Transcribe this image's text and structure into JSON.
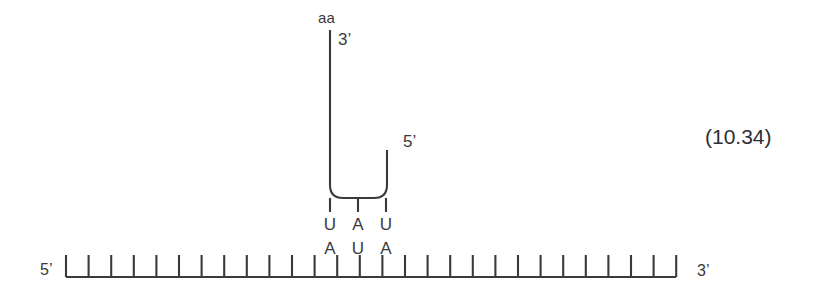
{
  "figure": {
    "equation_number": "(10.34)",
    "background_color": "#ffffff",
    "line_color": "#3a3a3a",
    "text_color": "#3a3a3a"
  },
  "trna": {
    "amino_acid_label": "aa",
    "acceptor_end_label": "3’",
    "five_prime_label": "5’",
    "anticodon": [
      "U",
      "A",
      "U"
    ]
  },
  "mrna": {
    "five_prime_label": "5’",
    "three_prime_label": "3’",
    "codon": [
      "A",
      "U",
      "A"
    ],
    "tick_count": 28,
    "tick_start_x": 66,
    "tick_spacing": 22.6
  },
  "geometry": {
    "baseline_y": 277,
    "tick_height": 22,
    "trna_left_stem_x": 330,
    "trna_right_stem_x": 387,
    "trna_top_y": 30,
    "trna_right_top_y": 150,
    "trna_bottom_y": 198,
    "corner_radius": 13,
    "anticodon_stem_xs": [
      330,
      358,
      386
    ],
    "anticodon_stem_bottom_y": 212
  }
}
